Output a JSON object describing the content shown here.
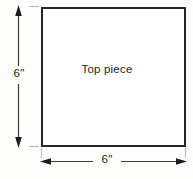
{
  "diagram": {
    "type": "technical-drawing",
    "background_color": "#fdfdfc",
    "shape": {
      "name": "Top piece",
      "label": "Top piece",
      "form": "square",
      "outline_color": "#262626",
      "fill_color": "#ffffff",
      "stroke_width": 2
    },
    "dimensions": [
      {
        "name": "height",
        "label": "6\"",
        "value": 6,
        "unit": "inch",
        "unit_symbol": "\"",
        "orientation": "vertical",
        "position": "left",
        "arrow_style": "double-ended",
        "line_color": "#3a3a3a"
      },
      {
        "name": "width",
        "label": "6\"",
        "value": 6,
        "unit": "inch",
        "unit_symbol": "\"",
        "orientation": "horizontal",
        "position": "bottom",
        "arrow_style": "double-ended",
        "line_color": "#3a3a3a"
      }
    ],
    "extension_line_color": "#bdbdbd"
  }
}
